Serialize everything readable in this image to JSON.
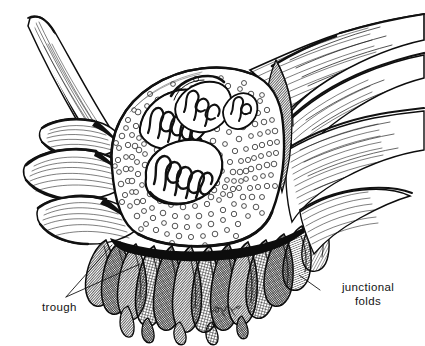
{
  "figure": {
    "kind": "scientific-illustration",
    "technique": "pen-and-ink stipple and hatching",
    "background_color": "#ffffff",
    "ink_color": "#111111",
    "width": 425,
    "height": 346
  },
  "labels": [
    {
      "id": "trough",
      "text": "trough",
      "x": 42,
      "y": 308,
      "anchor": "start",
      "leader": "branched-v",
      "leader_points": "two branches pointing up-right into the folded membrane region"
    },
    {
      "id": "junctional-folds",
      "line1": "junctional",
      "line2": "folds",
      "x": 368,
      "y": 291,
      "anchor": "middle",
      "leader": "straight",
      "leader_points": "single line pointing up-left to the folds"
    }
  ],
  "signature": {
    "text": "cursive artist monogram",
    "x": 222,
    "y": 312
  },
  "structures": [
    {
      "name": "axon-terminal",
      "description": "central bolus packed with synaptic vesicles"
    },
    {
      "name": "synaptic-vesicles",
      "description": "dense field of small circles filling the terminal"
    },
    {
      "name": "mitochondrion-upper-left",
      "description": "elongated organelle with zigzag cristae"
    },
    {
      "name": "mitochondrion-upper-right",
      "description": "small organelle with cristae"
    },
    {
      "name": "mitochondrion-lower-center",
      "description": "large oval organelle with zigzag cristae"
    },
    {
      "name": "schwann-cell-sheath",
      "description": "hatched sheet sweeping to upper right"
    },
    {
      "name": "nerve-process-upper-left",
      "description": "tapering curved process"
    },
    {
      "name": "left-lobed-flaps",
      "description": "stack of overlapping membrane flaps at left"
    },
    {
      "name": "junctional-folds",
      "description": "radiating finger-like folds along lower margin"
    },
    {
      "name": "trough",
      "description": "depression of the muscle surface holding the terminal"
    }
  ],
  "colors": {
    "ink": "#111111",
    "paper": "#ffffff",
    "label": "#141414"
  }
}
